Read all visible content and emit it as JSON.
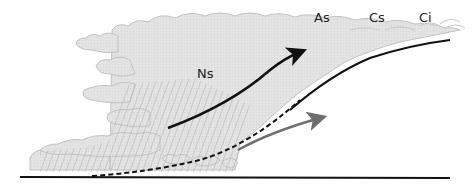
{
  "diagram": {
    "labels": {
      "ns": "Ns",
      "as": "As",
      "cs": "Cs",
      "ci": "Ci"
    },
    "colors": {
      "cloud_fill": "#e3e3e3",
      "cloud_outline": "#bdbdbd",
      "front_line": "#111111",
      "warm_air_arrow": "#111111",
      "cold_air_arrow": "#6e6e6e",
      "rain_hatch": "#b5b5b5",
      "ground": "#111111"
    }
  }
}
